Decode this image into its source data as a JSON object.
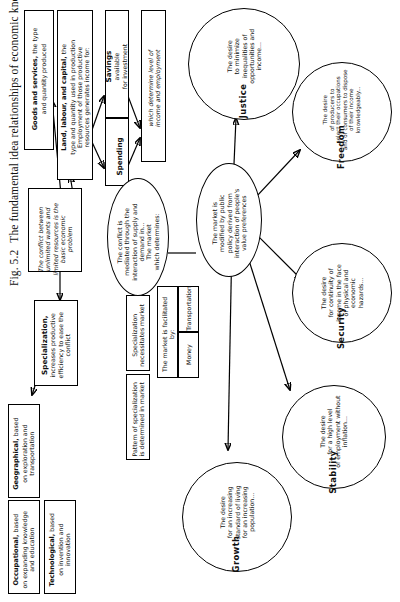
{
  "figure": {
    "number": "Fig. 5.2",
    "caption": "The fundamental idea relationships of economic knowledge."
  },
  "boxes": {
    "goods_services": {
      "lead": "Goods and services,",
      "rest": " the type\nand quantity produced"
    },
    "land_labour_capital": {
      "lead": "Land, labour, and capital,",
      "rest": " the\ntype and quantity used in production\nEmployment of those productive\nresources generates income for:"
    },
    "savings": {
      "lead": "Savings",
      "rest": "\navailable\nfor investment"
    },
    "spending": {
      "lead": "Spending",
      "rest": ""
    },
    "determine": {
      "lead": "",
      "rest": "which determine level of\nincome and employment"
    },
    "conflict": {
      "lead": "",
      "rest": "The conflict between unlimited wants and\nlimited resources is the basic economic\nproblem"
    },
    "specialization": {
      "lead": "Specialization,",
      "rest": "\nincreases productive\nefficiency to ease the\nconflict"
    },
    "geographical": {
      "lead": "Geographical,",
      "rest": " based\non exploration and\ntransportation"
    },
    "occupational": {
      "lead": "Occupational,",
      "rest": " based\non expanding knowledge\nand education"
    },
    "technological": {
      "lead": "Technological,",
      "rest": " based\non invention and\ninnovation"
    },
    "spec_necessitates": {
      "lead": "",
      "rest": "Specialization\nnecessitates market"
    },
    "spec_pattern": {
      "lead": "",
      "rest": "Pattern of specialization\nis determined in market"
    },
    "facilitated": {
      "lead": "",
      "rest": "The market is facilitated\nby:"
    },
    "money": {
      "lead": "",
      "rest": "Money"
    },
    "transportation": {
      "lead": "",
      "rest": "Transportation"
    }
  },
  "ellipses": {
    "conflict_mediated": "The conflict is\nmediated through the\ninteraction of supply and\ndemand in...\nThe market\nwhich determines:",
    "market_modified": "The market is\nmodified by public\npolicy derived from\ninteraction of people's\nvalue preferences"
  },
  "values": [
    {
      "id": "justice",
      "label": "Justice",
      "text": "The desire\nto minimize\ninequalities of\nopportunities and\nincome..."
    },
    {
      "id": "freedom",
      "label": "Freedom",
      "text": "The desire\nof producers to\nselect their occupations\nand of consumers to dispose\nof their income\nknowledgeably..."
    },
    {
      "id": "security",
      "label": "Security",
      "text": "The desire\nfor continuity of\nincome in the face\nof physical and\neconomic\nhazards..."
    },
    {
      "id": "stability",
      "label": "Stability",
      "text": "The desire\nfor a high level\nof employment without\ninflation..."
    },
    {
      "id": "growth",
      "label": "Growth",
      "text": "The desire\nfor an increasing\nstandard of living\nfor an increasing\npopulation..."
    }
  ]
}
